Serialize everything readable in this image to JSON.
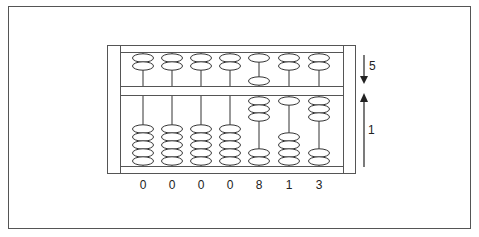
{
  "diagram": {
    "colors": {
      "line": "#333333",
      "background": "#ffffff",
      "frame": "#555555"
    },
    "columns": [
      {
        "digit": "0",
        "upper_down": 0,
        "lower_up": 0
      },
      {
        "digit": "0",
        "upper_down": 0,
        "lower_up": 0
      },
      {
        "digit": "0",
        "upper_down": 0,
        "lower_up": 0
      },
      {
        "digit": "0",
        "upper_down": 0,
        "lower_up": 0
      },
      {
        "digit": "8",
        "upper_down": 1,
        "lower_up": 3
      },
      {
        "digit": "1",
        "upper_down": 0,
        "lower_up": 1
      },
      {
        "digit": "3",
        "upper_down": 0,
        "lower_up": 3
      }
    ],
    "beads_per_upper": 2,
    "beads_per_lower": 5,
    "annotations": {
      "upper_arrow_label": "5",
      "upper_arrow_direction": "down",
      "lower_arrow_label": "1",
      "lower_arrow_direction": "up"
    }
  }
}
